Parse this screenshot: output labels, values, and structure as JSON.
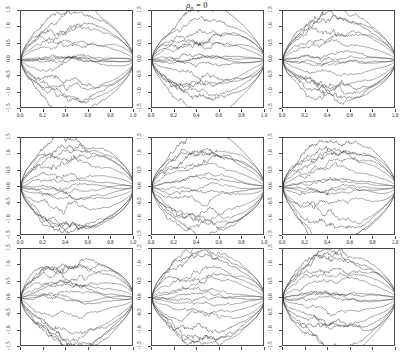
{
  "figure": {
    "title_rho": "ρ",
    "title_sub": "0",
    "title_rest": "= 0",
    "title_full": "ρ0 = 0",
    "width": 394,
    "height": 353,
    "background": "#ffffff",
    "line_color": "#2b2b2b",
    "frame_color": "#4a4a4a"
  },
  "chart_data": {
    "type": "line",
    "title": "ρ0 = 0",
    "xlabel": "",
    "ylabel": "",
    "xlim": [
      0,
      1
    ],
    "ylim": [
      -1.5,
      1.5
    ],
    "grid": false,
    "legend": null,
    "layout": {
      "rows": 3,
      "cols": 3,
      "shared_x": true,
      "shared_y": true
    },
    "xticks": [
      0.0,
      0.2,
      0.4,
      0.6,
      0.8,
      1.0
    ],
    "xticklabels": [
      "0.0",
      "0.2",
      "0.4",
      "0.6",
      "0.8",
      "1.0"
    ],
    "yticks": [
      -1.5,
      -1.0,
      -0.5,
      0.0,
      0.5,
      1.0,
      1.5
    ],
    "yticklabels": [
      "-1.5",
      "-1.0",
      "-0.5",
      "0.0",
      "0.5",
      "1.0",
      "1.5"
    ],
    "panels": [
      {
        "row": 1,
        "col": 1,
        "n_paths": 12,
        "seed": 11,
        "amp": 1.3,
        "xtick_labels_visible": true,
        "ytick_labels_visible": true
      },
      {
        "row": 1,
        "col": 2,
        "n_paths": 12,
        "seed": 27,
        "amp": 1.26,
        "xtick_labels_visible": true,
        "ytick_labels_visible": true
      },
      {
        "row": 1,
        "col": 3,
        "n_paths": 12,
        "seed": 43,
        "amp": 1.24,
        "xtick_labels_visible": true,
        "ytick_labels_visible": true
      },
      {
        "row": 2,
        "col": 1,
        "n_paths": 12,
        "seed": 59,
        "amp": 1.36,
        "xtick_labels_visible": true,
        "ytick_labels_visible": true
      },
      {
        "row": 2,
        "col": 2,
        "n_paths": 12,
        "seed": 71,
        "amp": 1.3,
        "xtick_labels_visible": true,
        "ytick_labels_visible": true
      },
      {
        "row": 2,
        "col": 3,
        "n_paths": 12,
        "seed": 89,
        "amp": 1.38,
        "xtick_labels_visible": true,
        "ytick_labels_visible": true
      },
      {
        "row": 3,
        "col": 1,
        "n_paths": 12,
        "seed": 103,
        "amp": 1.3,
        "xtick_labels_visible": false,
        "ytick_labels_visible": true
      },
      {
        "row": 3,
        "col": 2,
        "n_paths": 12,
        "seed": 127,
        "amp": 1.28,
        "xtick_labels_visible": false,
        "ytick_labels_visible": true
      },
      {
        "row": 3,
        "col": 3,
        "n_paths": 12,
        "seed": 149,
        "amp": 1.34,
        "xtick_labels_visible": false,
        "ytick_labels_visible": true
      }
    ],
    "envelope_levels": [
      1.3,
      1.05,
      0.8,
      0.42,
      0.12,
      -0.12,
      -0.42,
      -0.8,
      -1.05,
      -1.3
    ]
  }
}
